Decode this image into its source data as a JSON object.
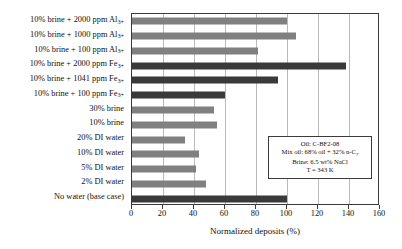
{
  "chart_data": {
    "type": "bar",
    "orientation": "horizontal",
    "title": "",
    "xlabel": "Normalized deposits (%)",
    "ylabel": "",
    "xlim": [
      0,
      160
    ],
    "xticks": [
      0,
      20,
      40,
      60,
      80,
      100,
      120,
      140,
      160
    ],
    "grid": true,
    "legend": "none",
    "categories": [
      "10% brine + 2000 ppm Al3+",
      "10% brine + 1000 ppm Al3+",
      "10% brine + 100 ppm Al3+",
      "10% brine + 2000 ppm Fe3+",
      "10% brine + 1041 ppm Fe3+",
      "10% brine + 100 ppm Fe3+",
      "30% brine",
      "10% brine",
      "20% DI water",
      "10% DI water",
      "5% DI water",
      "2% DI water",
      "No water (base case)"
    ],
    "values": [
      100,
      106,
      81,
      138,
      94,
      60,
      53,
      55,
      34,
      43,
      41,
      48,
      100
    ],
    "colors": [
      "#808080",
      "#808080",
      "#808080",
      "#3a3a3a",
      "#3a3a3a",
      "#3a3a3a",
      "#808080",
      "#808080",
      "#808080",
      "#808080",
      "#808080",
      "#808080",
      "#3a3a3a"
    ]
  },
  "ylabels": [
    {
      "pre": "10% brine + 2000 ppm Al",
      "sub": "3+"
    },
    {
      "pre": "10% brine + 1000 ppm Al",
      "sub": "3+"
    },
    {
      "pre": "10% brine + 100 ppm Al",
      "sub": "3+"
    },
    {
      "pre": "10% brine + 2000 ppm Fe",
      "sub": "3+"
    },
    {
      "pre": "10% brine + 1041 ppm Fe",
      "sub": "3+"
    },
    {
      "pre": "10% brine + 100 ppm Fe",
      "sub": "3+"
    },
    {
      "pre": "30% brine",
      "sub": ""
    },
    {
      "pre": "10% brine",
      "sub": ""
    },
    {
      "pre": "20% DI water",
      "sub": ""
    },
    {
      "pre": "10% DI water",
      "sub": ""
    },
    {
      "pre": "5% DI water",
      "sub": ""
    },
    {
      "pre": "2% DI water",
      "sub": ""
    },
    {
      "pre": "No water (base case)",
      "sub": ""
    }
  ],
  "inset": {
    "line1": "Oil: C-BF2-08",
    "line2_pre": "Mix oil: 68% oil + 32% n-C",
    "line2_sub": "7",
    "line3": "Brine: 6.5 wt% NaCl",
    "line4": "T = 343 K"
  }
}
